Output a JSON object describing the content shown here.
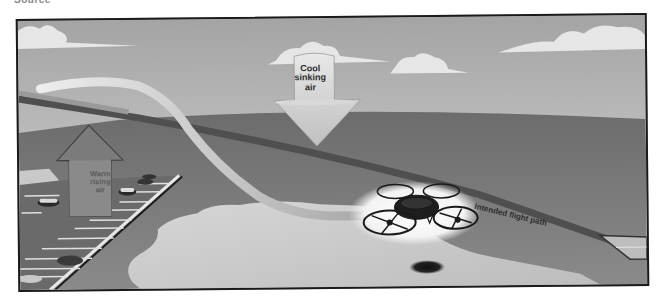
{
  "figure": {
    "caption_fragment": "Source"
  },
  "labels": {
    "cool_air": {
      "line1": "Cool",
      "line2": "sinking",
      "line3": "air"
    },
    "warm_air": {
      "line1": "Warm",
      "line2": "rising",
      "line3": "air"
    },
    "flight_path": "Intended flight path"
  },
  "scene": {
    "elements": [
      "sky-with-clouds",
      "ground-plane",
      "parking-lot-with-cars",
      "water-body",
      "warm-rising-air-arrow",
      "cool-sinking-air-arrow",
      "intended-flight-path-line",
      "actual-flight-path-ribbon",
      "quadcopter-drone",
      "drone-shadow",
      "helipad"
    ],
    "colors": {
      "sky_top": "#a9a9a9",
      "sky_bottom": "#d8d8d8",
      "ground": "#7a7a7a",
      "water": "#cfcfcf",
      "parking_lot": "#6e6e6e",
      "frame_border": "#1a1a1a",
      "drone_glow": "#f4f4f4"
    }
  }
}
